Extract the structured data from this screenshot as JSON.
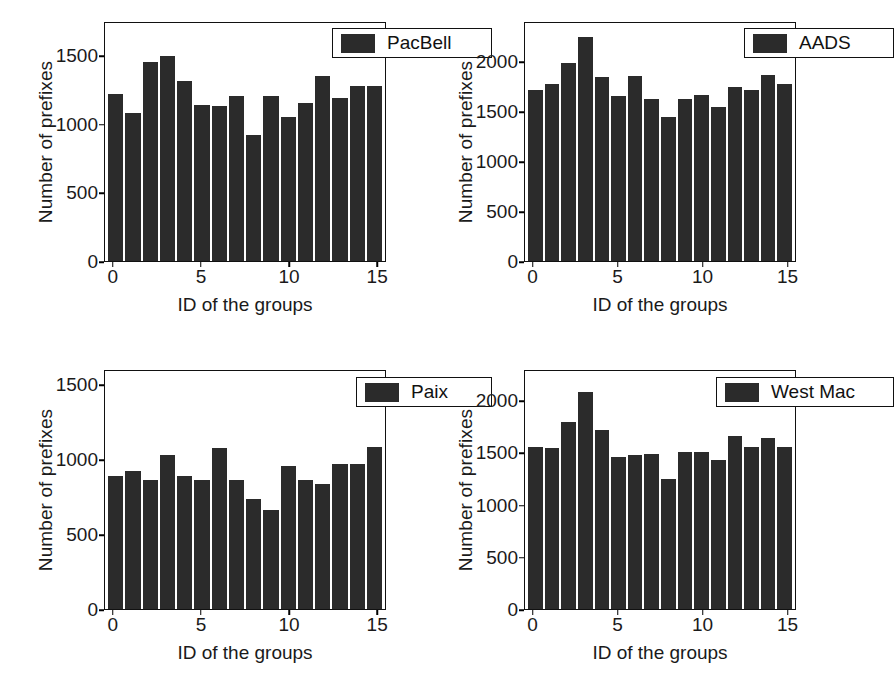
{
  "figure": {
    "axis_label_x": "ID of the groups",
    "axis_label_y": "Number of prefixes",
    "bar_color": "#2b2b2b",
    "frame_color": "#111111"
  },
  "chart_data": [
    {
      "type": "bar",
      "title": "PacBell",
      "legend": "PacBell",
      "legend_position": "top-right",
      "xlabel": "ID of the groups",
      "ylabel": "Number of prefixes",
      "grid": false,
      "xlim": [
        -0.5,
        15.5
      ],
      "ylim": [
        0,
        1750
      ],
      "xticks": [
        0,
        5,
        10,
        15
      ],
      "yticks": [
        0,
        500,
        1000,
        1500
      ],
      "categories": [
        0,
        1,
        2,
        3,
        4,
        5,
        6,
        7,
        8,
        9,
        10,
        11,
        12,
        13,
        14,
        15
      ],
      "values": [
        1225,
        1090,
        1465,
        1510,
        1320,
        1145,
        1140,
        1215,
        930,
        1210,
        1060,
        1165,
        1360,
        1200,
        1285,
        1285
      ]
    },
    {
      "type": "bar",
      "title": "AADS",
      "legend": "AADS",
      "legend_position": "top-right",
      "xlabel": "ID of the groups",
      "ylabel": "Number of prefixes",
      "grid": false,
      "xlim": [
        -0.5,
        15.5
      ],
      "ylim": [
        0,
        2400
      ],
      "xticks": [
        0,
        5,
        10,
        15
      ],
      "yticks": [
        0,
        500,
        1000,
        1500,
        2000
      ],
      "categories": [
        0,
        1,
        2,
        3,
        4,
        5,
        6,
        7,
        8,
        9,
        10,
        11,
        12,
        13,
        14,
        15
      ],
      "values": [
        1720,
        1780,
        2000,
        2255,
        1855,
        1660,
        1870,
        1630,
        1450,
        1635,
        1670,
        1550,
        1755,
        1720,
        1875,
        1790
      ]
    },
    {
      "type": "bar",
      "title": "Paix",
      "legend": "Paix",
      "legend_position": "top-right",
      "xlabel": "ID of the groups",
      "ylabel": "Number of prefixes",
      "grid": false,
      "xlim": [
        -0.5,
        15.5
      ],
      "ylim": [
        0,
        1600
      ],
      "xticks": [
        0,
        5,
        10,
        15
      ],
      "yticks": [
        0,
        500,
        1000,
        1500
      ],
      "categories": [
        0,
        1,
        2,
        3,
        4,
        5,
        6,
        7,
        8,
        9,
        10,
        11,
        12,
        13,
        14,
        15
      ],
      "values": [
        895,
        925,
        865,
        1035,
        895,
        865,
        1085,
        870,
        740,
        665,
        960,
        870,
        840,
        975,
        975,
        1090
      ]
    },
    {
      "type": "bar",
      "title": "West Mac",
      "legend": "West Mac",
      "legend_position": "top-right",
      "xlabel": "ID of the groups",
      "ylabel": "Number of prefixes",
      "grid": false,
      "xlim": [
        -0.5,
        15.5
      ],
      "ylim": [
        0,
        2300
      ],
      "xticks": [
        0,
        5,
        10,
        15
      ],
      "yticks": [
        0,
        500,
        1000,
        1500,
        2000
      ],
      "categories": [
        0,
        1,
        2,
        3,
        4,
        5,
        6,
        7,
        8,
        9,
        10,
        11,
        12,
        13,
        14,
        15
      ],
      "values": [
        1570,
        1560,
        1805,
        2100,
        1730,
        1470,
        1490,
        1500,
        1255,
        1515,
        1520,
        1440,
        1670,
        1565,
        1655,
        1565
      ]
    }
  ]
}
